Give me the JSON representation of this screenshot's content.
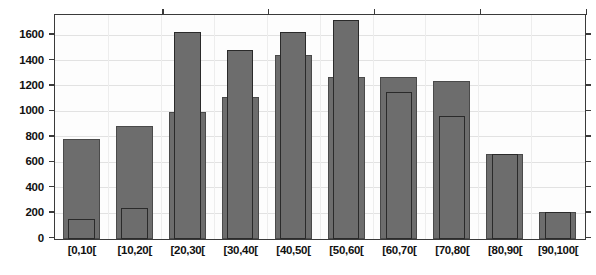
{
  "chart_data": {
    "type": "bar",
    "title": "",
    "subtitle": "",
    "xlabel": "",
    "ylabel": "",
    "categories": [
      "[0,10[",
      "[10,20[",
      "[20,30[",
      "[30,40[",
      "[40,50[",
      "[50,60[",
      "[60,70[",
      "[70,80[",
      "[80,90[",
      "[90,100["
    ],
    "series": [
      {
        "name": "background",
        "values": [
          790,
          885,
          995,
          1115,
          1450,
          1270,
          1270,
          1240,
          670,
          215
        ]
      },
      {
        "name": "overlay",
        "values": [
          155,
          240,
          1630,
          1490,
          1630,
          1720,
          1155,
          970,
          670,
          215
        ]
      }
    ],
    "ylim": [
      0,
      1755
    ],
    "xlim": [
      0,
      10
    ],
    "yticks": [
      0,
      200,
      400,
      600,
      800,
      1000,
      1200,
      1400,
      1600
    ],
    "ytick_labels": [
      "0",
      "200",
      "400",
      "600",
      "800",
      "1000",
      "1200",
      "1400",
      "1600"
    ],
    "grid": true,
    "legend": "none",
    "annotations": []
  },
  "axis": {
    "y_tick_labels": [
      "1600",
      "1400",
      "1200",
      "1000",
      "800",
      "600",
      "400",
      "200",
      "0"
    ],
    "x_tick_labels": [
      "[0,10[",
      "[10,20[",
      "[20,30[",
      "[30,40[",
      "[40,50[",
      "[50,60[",
      "[60,70[",
      "[70,80[",
      "[80,90[",
      "[90,100["
    ]
  },
  "colors": {
    "bar_fill": "#6d6d6d",
    "bar_outline_outer": "#4a4a4a",
    "bar_outline_inner": "#2a2a2a",
    "frame": "#3a3a3a",
    "grid": "#e2e2e2",
    "background": "#ffffff",
    "text": "#111111"
  }
}
